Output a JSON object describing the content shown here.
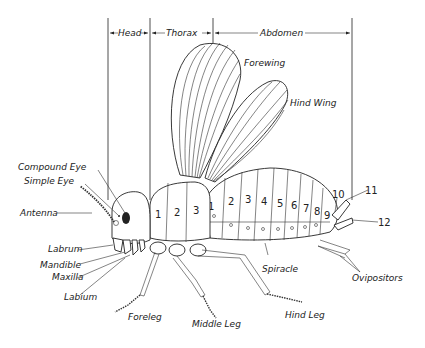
{
  "regions": {
    "head": "Head",
    "thorax": "Thorax",
    "abdomen": "Abdomen"
  },
  "labels": {
    "forewing": "Forewing",
    "hind_wing": "Hind Wing",
    "compound_eye": "Compound Eye",
    "simple_eye": "Simple Eye",
    "antenna": "Antenna",
    "labrum": "Labrum",
    "mandible": "Mandible",
    "maxilla": "Maxilla",
    "labium": "Labium",
    "foreleg": "Foreleg",
    "middle_leg": "Middle Leg",
    "hind_leg": "Hind Leg",
    "spiracle": "Spiracle",
    "ovipositors": "Ovipositors"
  },
  "thorax_segments": [
    "1",
    "2",
    "3"
  ],
  "abdomen_segments": [
    "1",
    "2",
    "3",
    "4",
    "5",
    "6",
    "7",
    "8",
    "9",
    "10",
    "11",
    "12"
  ]
}
